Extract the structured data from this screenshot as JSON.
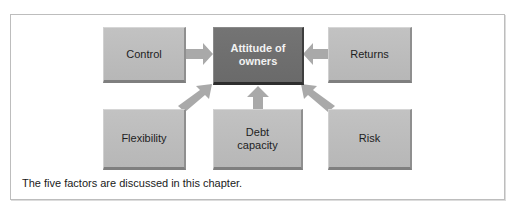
{
  "figure": {
    "caption": "The five factors are discussed in this chapter.",
    "center_node": {
      "line1": "Attitude of",
      "line2": "owners"
    },
    "factors": [
      {
        "id": "control",
        "label": "Control"
      },
      {
        "id": "returns",
        "label": "Returns"
      },
      {
        "id": "flexibility",
        "label": "Flexibility"
      },
      {
        "id": "debt_capacity",
        "line1": "Debt",
        "line2": "capacity"
      },
      {
        "id": "risk",
        "label": "Risk"
      }
    ],
    "colors": {
      "factor_box": "#bcbcbc",
      "center_box": "#707070",
      "arrow": "#a9a9a9",
      "frame_border": "#bdbdbd"
    }
  }
}
